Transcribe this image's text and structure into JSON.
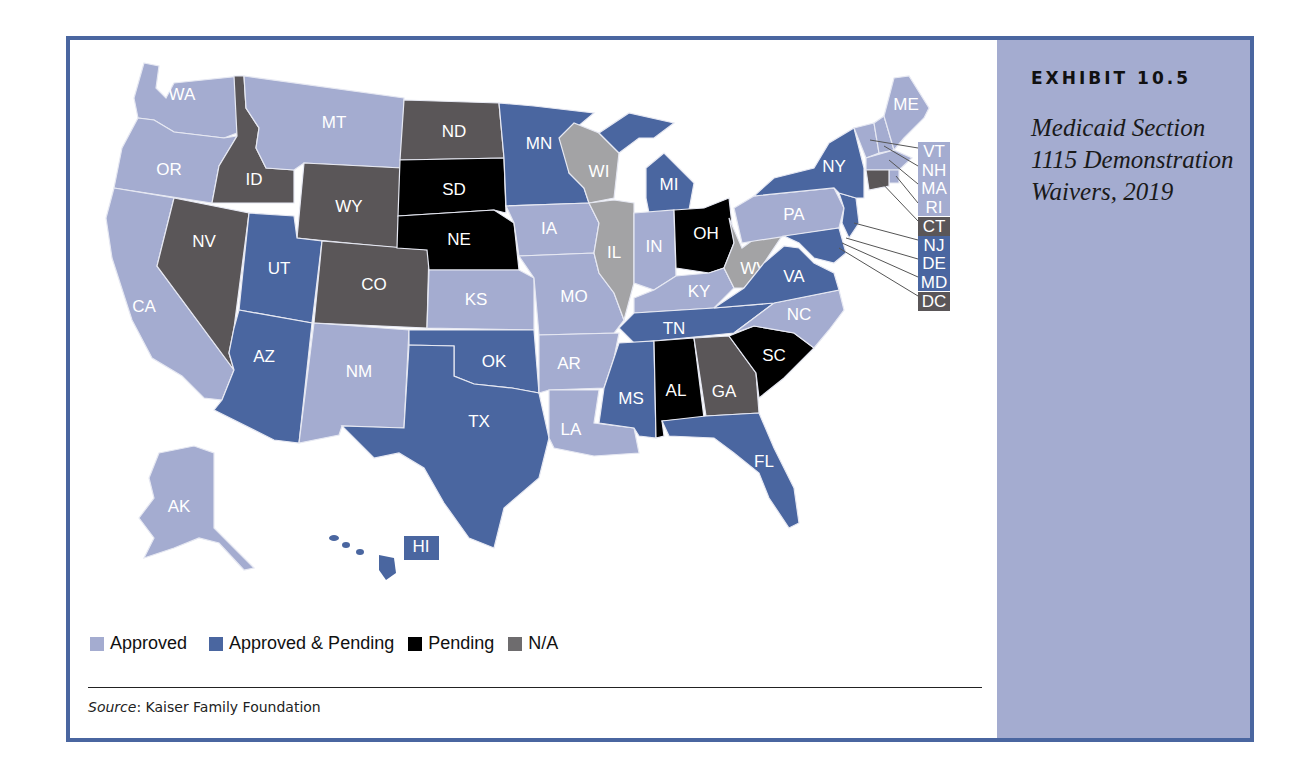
{
  "exhibit": {
    "label": "EXHIBIT 10.5",
    "title": "Medicaid Section 1115 Demonstration Waivers, 2019"
  },
  "legend": {
    "items": [
      {
        "label": "Approved",
        "color": "#a4acd0"
      },
      {
        "label": "Approved & Pending",
        "color": "#4a66a0"
      },
      {
        "label": "Pending",
        "color": "#000000"
      },
      {
        "label": "N/A",
        "color": "#5a5658"
      }
    ]
  },
  "source": {
    "prefix": "Source",
    "text": ": Kaiser Family Foundation"
  },
  "colors": {
    "approved": "#a4acd0",
    "approved_pending": "#4a66a0",
    "pending": "#000000",
    "na": "#5a5658",
    "light_gray": "#a3a3a5",
    "frame": "#4a66a0",
    "sidebar": "#a4acd0"
  },
  "states": {
    "WA": {
      "label": "WA",
      "status": "Approved"
    },
    "OR": {
      "label": "OR",
      "status": "Approved"
    },
    "CA": {
      "label": "CA",
      "status": "Approved"
    },
    "ID": {
      "label": "ID",
      "status": "N/A"
    },
    "NV": {
      "label": "NV",
      "status": "N/A"
    },
    "MT": {
      "label": "MT",
      "status": "Approved"
    },
    "WY": {
      "label": "WY",
      "status": "N/A"
    },
    "UT": {
      "label": "UT",
      "status": "Approved & Pending"
    },
    "AZ": {
      "label": "AZ",
      "status": "Approved & Pending"
    },
    "CO": {
      "label": "CO",
      "status": "N/A"
    },
    "NM": {
      "label": "NM",
      "status": "Approved"
    },
    "ND": {
      "label": "ND",
      "status": "N/A"
    },
    "SD": {
      "label": "SD",
      "status": "Pending"
    },
    "NE": {
      "label": "NE",
      "status": "Pending"
    },
    "KS": {
      "label": "KS",
      "status": "Approved"
    },
    "OK": {
      "label": "OK",
      "status": "Approved & Pending"
    },
    "TX": {
      "label": "TX",
      "status": "Approved & Pending"
    },
    "MN": {
      "label": "MN",
      "status": "Approved & Pending"
    },
    "IA": {
      "label": "IA",
      "status": "Approved"
    },
    "MO": {
      "label": "MO",
      "status": "Approved"
    },
    "AR": {
      "label": "AR",
      "status": "Approved"
    },
    "LA": {
      "label": "LA",
      "status": "Approved"
    },
    "WI": {
      "label": "WI",
      "status": "Light gray"
    },
    "IL": {
      "label": "IL",
      "status": "Light gray"
    },
    "MI": {
      "label": "MI",
      "status": "Approved & Pending"
    },
    "IN": {
      "label": "IN",
      "status": "Approved"
    },
    "OH": {
      "label": "OH",
      "status": "Pending"
    },
    "KY": {
      "label": "KY",
      "status": "Approved"
    },
    "TN": {
      "label": "TN",
      "status": "Approved & Pending"
    },
    "MS": {
      "label": "MS",
      "status": "Approved & Pending"
    },
    "AL": {
      "label": "AL",
      "status": "Pending"
    },
    "GA": {
      "label": "GA",
      "status": "N/A"
    },
    "FL": {
      "label": "FL",
      "status": "Approved & Pending"
    },
    "SC": {
      "label": "SC",
      "status": "Pending"
    },
    "NC": {
      "label": "NC",
      "status": "Approved"
    },
    "VA": {
      "label": "VA",
      "status": "Approved & Pending"
    },
    "WV": {
      "label": "WV",
      "status": "Light gray"
    },
    "PA": {
      "label": "PA",
      "status": "Approved"
    },
    "NY": {
      "label": "NY",
      "status": "Approved & Pending"
    },
    "ME": {
      "label": "ME",
      "status": "Approved"
    },
    "AK": {
      "label": "AK",
      "status": "Approved"
    },
    "HI": {
      "label": "HI",
      "status": "Approved & Pending"
    }
  },
  "callouts": [
    {
      "label": "VT",
      "status": "Approved"
    },
    {
      "label": "NH",
      "status": "Approved"
    },
    {
      "label": "MA",
      "status": "Approved"
    },
    {
      "label": "RI",
      "status": "Approved"
    },
    {
      "label": "CT",
      "status": "N/A"
    },
    {
      "label": "NJ",
      "status": "Approved & Pending"
    },
    {
      "label": "DE",
      "status": "Approved & Pending"
    },
    {
      "label": "MD",
      "status": "Approved & Pending"
    },
    {
      "label": "DC",
      "status": "N/A"
    }
  ]
}
